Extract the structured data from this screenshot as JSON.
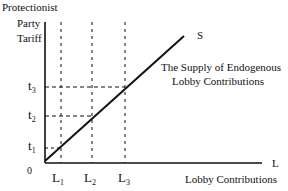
{
  "diagram": {
    "y_axis_label": [
      "Protectionist",
      "Party",
      "Tariff"
    ],
    "x_axis_label": "Lobby Contributions",
    "x_axis_letter": "L",
    "origin": "0",
    "curve_label": "S",
    "curve_caption": [
      "The Supply of Endogenous",
      "Lobby Contributions"
    ],
    "y_ticks": [
      {
        "base": "t",
        "sub": "3"
      },
      {
        "base": "t",
        "sub": "2"
      },
      {
        "base": "t",
        "sub": "1"
      }
    ],
    "x_ticks": [
      {
        "base": "L",
        "sub": "1"
      },
      {
        "base": "L",
        "sub": "2"
      },
      {
        "base": "L",
        "sub": "3"
      }
    ],
    "line_color": "#111111",
    "background": "#ffffff"
  }
}
